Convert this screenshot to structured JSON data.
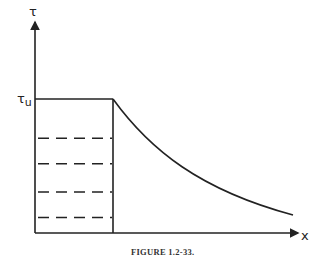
{
  "figure": {
    "caption": "FIGURE 1.2-33.",
    "y_axis_label": "τ",
    "x_axis_label": "x",
    "level_label_main": "τ",
    "level_label_sub": "u"
  },
  "chart_data": {
    "type": "line",
    "title": "",
    "xlabel": "x",
    "ylabel": "τ",
    "annotations": [
      "τu"
    ],
    "segments": [
      {
        "name": "plateau",
        "style": "solid",
        "x": [
          0,
          1
        ],
        "y": [
          1,
          1
        ]
      },
      {
        "name": "boundary",
        "style": "solid",
        "x": [
          1,
          1
        ],
        "y": [
          0,
          1
        ]
      },
      {
        "name": "decay",
        "style": "solid",
        "x": [
          1,
          1.5,
          2,
          2.5,
          3.3
        ],
        "y": [
          1,
          0.67,
          0.45,
          0.3,
          0.14
        ]
      }
    ],
    "hatch_levels": [
      0.71,
      0.52,
      0.31,
      0.12
    ],
    "colors": {
      "line": "#222222"
    }
  }
}
